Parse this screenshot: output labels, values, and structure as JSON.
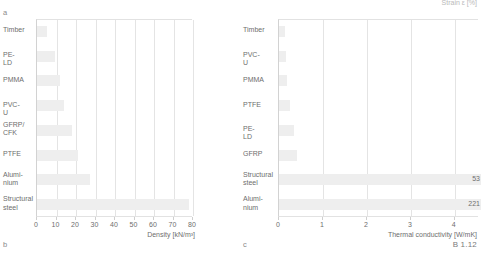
{
  "figure": {
    "reference": "B 1.12",
    "top_cut_label": "Strain ε [%]",
    "panel_a": "a",
    "panel_b": "b",
    "panel_c": "c"
  },
  "chart_data": [
    {
      "id": "density",
      "type": "bar",
      "orientation": "horizontal",
      "title": "",
      "xlabel": "Density [kN/m³]",
      "ylabel": "",
      "xlim": [
        0,
        80
      ],
      "xticks": [
        0,
        10,
        20,
        30,
        40,
        50,
        60,
        70,
        80
      ],
      "xtick_labels": [
        "0",
        "10",
        "20",
        "30",
        "40",
        "50",
        "60",
        "70",
        "80"
      ],
      "grid": true,
      "legend": "none",
      "bar_color": "#eeeeee",
      "categories": [
        "Timber",
        "PE-LD",
        "PMMA",
        "PVC-U",
        "GFRP/\nCFK",
        "PTFE",
        "Alumi-\nnium",
        "Structural\nsteel"
      ],
      "values": [
        5,
        9,
        12,
        14,
        18,
        21,
        27,
        78
      ],
      "value_labels": [
        "",
        "",
        "",
        "",
        "",
        "",
        "",
        ""
      ]
    },
    {
      "id": "thermal-conductivity",
      "type": "bar",
      "orientation": "horizontal",
      "title": "",
      "xlabel": "Thermal conductivity [W/mK]",
      "ylabel": "",
      "xlim": [
        0,
        4.55
      ],
      "xticks": [
        0,
        1,
        2,
        3,
        4
      ],
      "xtick_labels": [
        "0",
        "1",
        "2",
        "3",
        "4"
      ],
      "grid": true,
      "legend": "none",
      "bar_color": "#eeeeee",
      "categories": [
        "Timber",
        "PVC-U",
        "PMMA",
        "PTFE",
        "PE-LD",
        "GFRP",
        "Structural\nsteel",
        "Alumi-\nnium"
      ],
      "values": [
        0.13,
        0.16,
        0.19,
        0.25,
        0.33,
        0.4,
        53,
        221
      ],
      "value_labels": [
        "",
        "",
        "",
        "",
        "",
        "",
        "53",
        "221"
      ]
    }
  ]
}
